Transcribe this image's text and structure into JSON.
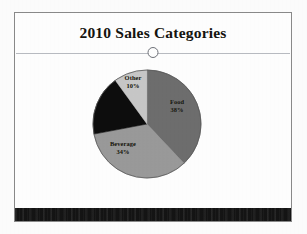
{
  "slide": {
    "title": "2010 Sales Categories",
    "divider_icon": "ring-icon",
    "frame_color": "#8a8a8a",
    "background_color": "#ffffff",
    "bottom_band_color": "#141414"
  },
  "chart_data": {
    "type": "pie",
    "title": "2010 Sales Categories",
    "categories": [
      "Food",
      "Beverage",
      "Unlabeled",
      "Other"
    ],
    "values": [
      38,
      34,
      18,
      10
    ],
    "labels": [
      "Food 38%",
      "Beverage 34%",
      "",
      "Other 10%"
    ],
    "colors": [
      "#6e6e6e",
      "#9a9a9a",
      "#0d0d0d",
      "#c8c8c8"
    ],
    "legend": "none",
    "grid": false,
    "start_angle_deg": 0,
    "slices": [
      {
        "name": "Food",
        "label": "Food",
        "pct": "38%",
        "value": 38,
        "color": "#6e6e6e"
      },
      {
        "name": "Beverage",
        "label": "Beverage",
        "pct": "34%",
        "value": 34,
        "color": "#9a9a9a"
      },
      {
        "name": "Unlabeled",
        "label": "",
        "pct": "",
        "value": 18,
        "color": "#0d0d0d"
      },
      {
        "name": "Other",
        "label": "Other",
        "pct": "10%",
        "value": 10,
        "color": "#c8c8c8"
      }
    ]
  }
}
